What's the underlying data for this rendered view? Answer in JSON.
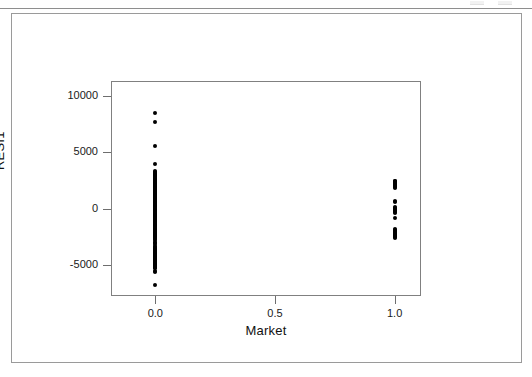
{
  "window": {
    "top_strip_present": true
  },
  "figure": {
    "frame_color": "#9a9a9a",
    "panel_color": "#808080",
    "point_color": "#000000",
    "background": "#ffffff"
  },
  "chart_data": {
    "type": "scatter",
    "title": "",
    "xlabel": "Market",
    "ylabel": "RESI1",
    "xlim": [
      -0.185,
      1.11
    ],
    "ylim": [
      -7700,
      11300
    ],
    "grid": false,
    "legend": null,
    "xticks": [
      0.0,
      0.5,
      1.0
    ],
    "xticklabels": [
      "0.0",
      "0.5",
      "1.0"
    ],
    "yticks": [
      10000,
      5000,
      0,
      -5000
    ],
    "yticklabels": [
      "10000",
      "5000",
      "0",
      "-5000"
    ],
    "series": [
      {
        "name": "Residuals vs Market",
        "marker": "filled-circle",
        "color": "#000000",
        "points": [
          [
            0.0,
            8450
          ],
          [
            0.0,
            7700
          ],
          [
            0.0,
            5550
          ],
          [
            0.0,
            3950
          ],
          [
            0.0,
            3350
          ],
          [
            0.0,
            3250
          ],
          [
            0.0,
            3180
          ],
          [
            0.0,
            3100
          ],
          [
            0.0,
            3020
          ],
          [
            0.0,
            2950
          ],
          [
            0.0,
            2880
          ],
          [
            0.0,
            2810
          ],
          [
            0.0,
            2740
          ],
          [
            0.0,
            2670
          ],
          [
            0.0,
            2600
          ],
          [
            0.0,
            2530
          ],
          [
            0.0,
            2460
          ],
          [
            0.0,
            2390
          ],
          [
            0.0,
            2320
          ],
          [
            0.0,
            2250
          ],
          [
            0.0,
            2180
          ],
          [
            0.0,
            2110
          ],
          [
            0.0,
            2040
          ],
          [
            0.0,
            1970
          ],
          [
            0.0,
            1900
          ],
          [
            0.0,
            1830
          ],
          [
            0.0,
            1760
          ],
          [
            0.0,
            1690
          ],
          [
            0.0,
            1620
          ],
          [
            0.0,
            1550
          ],
          [
            0.0,
            1480
          ],
          [
            0.0,
            1410
          ],
          [
            0.0,
            1340
          ],
          [
            0.0,
            1270
          ],
          [
            0.0,
            1200
          ],
          [
            0.0,
            1130
          ],
          [
            0.0,
            1060
          ],
          [
            0.0,
            990
          ],
          [
            0.0,
            920
          ],
          [
            0.0,
            850
          ],
          [
            0.0,
            780
          ],
          [
            0.0,
            710
          ],
          [
            0.0,
            640
          ],
          [
            0.0,
            570
          ],
          [
            0.0,
            500
          ],
          [
            0.0,
            430
          ],
          [
            0.0,
            360
          ],
          [
            0.0,
            290
          ],
          [
            0.0,
            220
          ],
          [
            0.0,
            150
          ],
          [
            0.0,
            80
          ],
          [
            0.0,
            10
          ],
          [
            0.0,
            -60
          ],
          [
            0.0,
            -130
          ],
          [
            0.0,
            -200
          ],
          [
            0.0,
            -270
          ],
          [
            0.0,
            -340
          ],
          [
            0.0,
            -410
          ],
          [
            0.0,
            -480
          ],
          [
            0.0,
            -550
          ],
          [
            0.0,
            -620
          ],
          [
            0.0,
            -690
          ],
          [
            0.0,
            -760
          ],
          [
            0.0,
            -830
          ],
          [
            0.0,
            -900
          ],
          [
            0.0,
            -970
          ],
          [
            0.0,
            -1040
          ],
          [
            0.0,
            -1110
          ],
          [
            0.0,
            -1180
          ],
          [
            0.0,
            -1250
          ],
          [
            0.0,
            -1320
          ],
          [
            0.0,
            -1390
          ],
          [
            0.0,
            -1460
          ],
          [
            0.0,
            -1530
          ],
          [
            0.0,
            -1600
          ],
          [
            0.0,
            -1670
          ],
          [
            0.0,
            -1740
          ],
          [
            0.0,
            -1810
          ],
          [
            0.0,
            -1880
          ],
          [
            0.0,
            -1950
          ],
          [
            0.0,
            -2020
          ],
          [
            0.0,
            -2090
          ],
          [
            0.0,
            -2160
          ],
          [
            0.0,
            -2230
          ],
          [
            0.0,
            -2300
          ],
          [
            0.0,
            -2370
          ],
          [
            0.0,
            -2440
          ],
          [
            0.0,
            -2510
          ],
          [
            0.0,
            -2580
          ],
          [
            0.0,
            -2650
          ],
          [
            0.0,
            -2720
          ],
          [
            0.0,
            -2950
          ],
          [
            0.0,
            -3020
          ],
          [
            0.0,
            -3090
          ],
          [
            0.0,
            -3300
          ],
          [
            0.0,
            -3370
          ],
          [
            0.0,
            -3440
          ],
          [
            0.0,
            -3510
          ],
          [
            0.0,
            -3580
          ],
          [
            0.0,
            -3650
          ],
          [
            0.0,
            -3720
          ],
          [
            0.0,
            -3790
          ],
          [
            0.0,
            -3860
          ],
          [
            0.0,
            -3930
          ],
          [
            0.0,
            -4000
          ],
          [
            0.0,
            -4070
          ],
          [
            0.0,
            -4140
          ],
          [
            0.0,
            -4210
          ],
          [
            0.0,
            -4280
          ],
          [
            0.0,
            -4350
          ],
          [
            0.0,
            -4420
          ],
          [
            0.0,
            -4490
          ],
          [
            0.0,
            -4560
          ],
          [
            0.0,
            -4630
          ],
          [
            0.0,
            -4700
          ],
          [
            0.0,
            -4770
          ],
          [
            0.0,
            -4840
          ],
          [
            0.0,
            -4910
          ],
          [
            0.0,
            -4980
          ],
          [
            0.0,
            -5050
          ],
          [
            0.0,
            -5120
          ],
          [
            0.0,
            -5190
          ],
          [
            0.0,
            -5260
          ],
          [
            0.0,
            -5520
          ],
          [
            0.0,
            -5620
          ],
          [
            0.0,
            -6700
          ],
          [
            1.0,
            2500
          ],
          [
            1.0,
            2420
          ],
          [
            1.0,
            2340
          ],
          [
            1.0,
            2260
          ],
          [
            1.0,
            2180
          ],
          [
            1.0,
            2100
          ],
          [
            1.0,
            2020
          ],
          [
            1.0,
            1940
          ],
          [
            1.0,
            1860
          ],
          [
            1.0,
            700
          ],
          [
            1.0,
            620
          ],
          [
            1.0,
            150
          ],
          [
            1.0,
            70
          ],
          [
            1.0,
            -10
          ],
          [
            1.0,
            -90
          ],
          [
            1.0,
            -170
          ],
          [
            1.0,
            -250
          ],
          [
            1.0,
            -330
          ],
          [
            1.0,
            -820
          ],
          [
            1.0,
            -1800
          ],
          [
            1.0,
            -1880
          ],
          [
            1.0,
            -1960
          ],
          [
            1.0,
            -2040
          ],
          [
            1.0,
            -2120
          ],
          [
            1.0,
            -2200
          ],
          [
            1.0,
            -2280
          ],
          [
            1.0,
            -2360
          ],
          [
            1.0,
            -2440
          ],
          [
            1.0,
            -2520
          ],
          [
            1.0,
            -2600
          ]
        ]
      }
    ]
  }
}
